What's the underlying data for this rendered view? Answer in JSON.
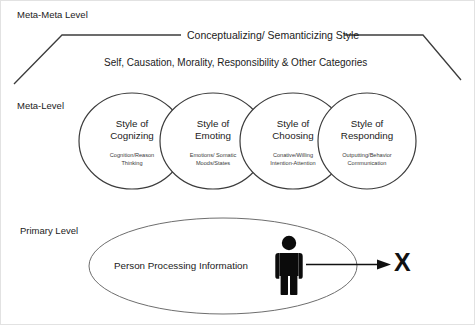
{
  "diagram": {
    "levels": {
      "meta_meta": "Meta-Meta Level",
      "meta": "Meta-Level",
      "primary": "Primary Level"
    },
    "meta_meta_band": {
      "title": "Conceptualizing/ Semanticizing Style",
      "subtitle": "Self, Causation, Morality, Responsibility & Other Categories"
    },
    "styles": [
      {
        "title_line1": "Style of",
        "title_line2": "Cognizing",
        "sub_line1": "Cognition/Reason",
        "sub_line2": "Thinking"
      },
      {
        "title_line1": "Style of",
        "title_line2": "Emoting",
        "sub_line1": "Emotions/ Somatic",
        "sub_line2": "Moods/States"
      },
      {
        "title_line1": "Style of",
        "title_line2": "Choosing",
        "sub_line1": "Conative/Willing",
        "sub_line2": "Intention-Attention"
      },
      {
        "title_line1": "Style of",
        "title_line2": "Responding",
        "sub_line1": "Outputting/Behavior",
        "sub_line2": "Communication"
      }
    ],
    "primary": {
      "label": "Person Processing Information",
      "person_icon": "person-figure-icon",
      "arrow_icon": "arrow-right-icon",
      "target": "X"
    },
    "colors": {
      "stroke": "#3c3c3c",
      "text": "#1b1b1b",
      "subtext": "#3a3a3a",
      "fill": "#ffffff",
      "person": "#0b0b0b"
    }
  }
}
